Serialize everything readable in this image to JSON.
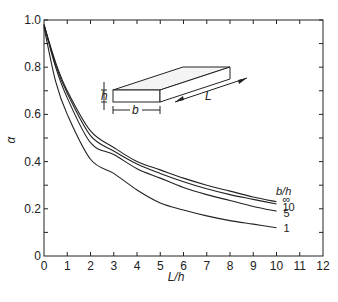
{
  "chart_data": {
    "type": "line",
    "title": "",
    "xlabel": "L/h",
    "ylabel": "α",
    "xlim": [
      0,
      12
    ],
    "ylim": [
      0,
      1.0
    ],
    "grid": false,
    "x_ticks": [
      "0",
      "1",
      "2",
      "3",
      "4",
      "5",
      "6",
      "7",
      "8",
      "9",
      "10",
      "11",
      "12"
    ],
    "y_ticks": [
      "0",
      "0.2",
      "0.4",
      "0.6",
      "0.8",
      "1.0"
    ],
    "legend_title": "b/h",
    "legend_position": "right end of curves",
    "x": [
      0,
      0.5,
      1,
      2,
      3,
      4,
      5,
      6,
      7,
      8,
      9,
      10
    ],
    "series": [
      {
        "name": "∞",
        "values": [
          0.98,
          0.82,
          0.7,
          0.53,
          0.46,
          0.4,
          0.365,
          0.33,
          0.3,
          0.275,
          0.25,
          0.23
        ]
      },
      {
        "name": "10",
        "values": [
          0.98,
          0.81,
          0.69,
          0.51,
          0.445,
          0.39,
          0.35,
          0.315,
          0.285,
          0.26,
          0.24,
          0.22
        ]
      },
      {
        "name": "5",
        "values": [
          0.98,
          0.8,
          0.67,
          0.48,
          0.43,
          0.37,
          0.33,
          0.29,
          0.26,
          0.235,
          0.21,
          0.19
        ]
      },
      {
        "name": "1",
        "values": [
          0.97,
          0.74,
          0.6,
          0.41,
          0.35,
          0.28,
          0.225,
          0.195,
          0.17,
          0.15,
          0.135,
          0.12
        ]
      }
    ],
    "annotations": {
      "inset_labels": {
        "height": "h",
        "width": "b",
        "length": "L"
      }
    }
  },
  "colors": {
    "line": "#222222",
    "background": "#ffffff"
  }
}
